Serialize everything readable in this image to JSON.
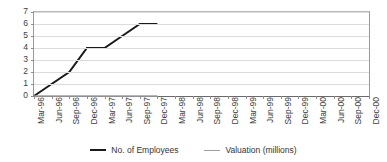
{
  "chart_data": {
    "type": "line",
    "title": "",
    "xlabel": "",
    "ylabel": "",
    "ylim": [
      0,
      7
    ],
    "ytick_labels": [
      "7",
      "6",
      "5",
      "4",
      "3",
      "2",
      "1",
      "0"
    ],
    "yticks": [
      7,
      6,
      5,
      4,
      3,
      2,
      1,
      0
    ],
    "grid": true,
    "legend_position": "bottom",
    "categories": [
      "Mar-96",
      "Jun-96",
      "Sep-96",
      "Dec-96",
      "Mar-97",
      "Jun-97",
      "Sep-97",
      "Dec-97",
      "Mar-98",
      "Jun-98",
      "Sep-98",
      "Dec-98",
      "Mar-99",
      "Jun-99",
      "Sep-99",
      "Dec-99",
      "Mar-00",
      "Jun-00",
      "Sep-00",
      "Dec-00"
    ],
    "series": [
      {
        "name": "No. of Employees",
        "color": "#1a1a1a",
        "values": [
          0,
          1,
          2,
          4,
          4,
          5,
          6,
          6,
          null,
          null,
          null,
          null,
          null,
          null,
          null,
          null,
          null,
          null,
          null,
          null
        ]
      },
      {
        "name": "Valuation (millions)",
        "color": "#9e9e9e",
        "values": [
          0,
          0,
          0,
          0,
          0,
          0,
          0,
          0,
          null,
          null,
          null,
          null,
          null,
          null,
          null,
          null,
          null,
          null,
          null,
          null
        ]
      }
    ]
  },
  "legend": {
    "items": [
      {
        "label": "No. of Employees"
      },
      {
        "label": "Valuation (millions)"
      }
    ]
  }
}
